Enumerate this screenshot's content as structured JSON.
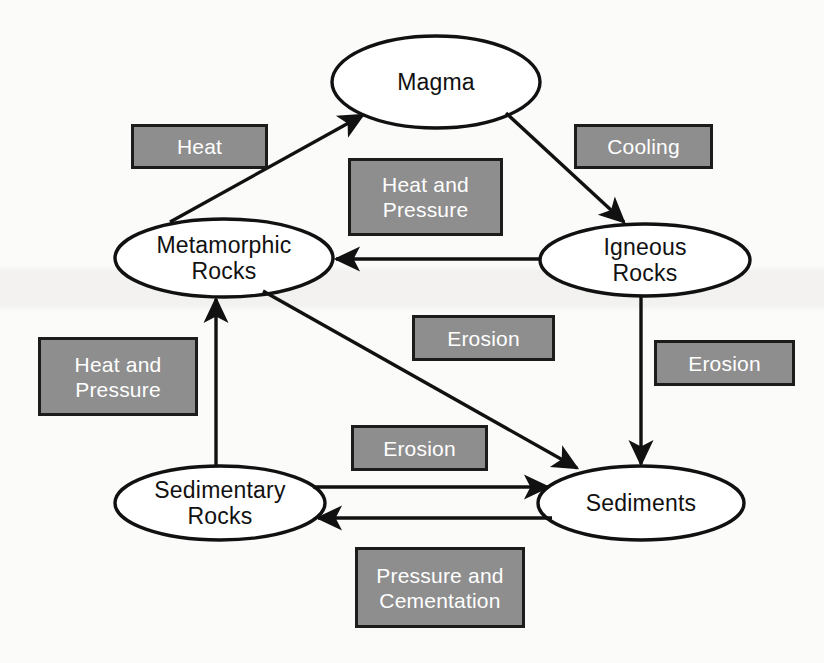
{
  "diagram": {
    "type": "cycle-flow-diagram",
    "canvas": {
      "width": 824,
      "height": 663
    },
    "colors": {
      "background": "#fbfbfa",
      "node_fill": "#ffffff",
      "node_stroke": "#111111",
      "process_fill": "#8e8e8e",
      "process_border": "#1c1c1c",
      "process_text": "#ffffff",
      "node_text": "#111111",
      "arrow": "#111111"
    },
    "nodes": [
      {
        "id": "magma",
        "label": "Magma",
        "shape": "ellipse",
        "cx": 436,
        "cy": 82,
        "rx": 104,
        "ry": 46
      },
      {
        "id": "metamorphic",
        "label": "Metamorphic\nRocks",
        "shape": "ellipse",
        "cx": 224,
        "cy": 258,
        "rx": 109,
        "ry": 39
      },
      {
        "id": "igneous",
        "label": "Igneous\nRocks",
        "shape": "ellipse",
        "cx": 645,
        "cy": 260,
        "rx": 105,
        "ry": 36
      },
      {
        "id": "sedimentary",
        "label": "Sedimentary\nRocks",
        "shape": "ellipse",
        "cx": 220,
        "cy": 503,
        "rx": 105,
        "ry": 37
      },
      {
        "id": "sediments",
        "label": "Sediments",
        "shape": "ellipse",
        "cx": 641,
        "cy": 503,
        "rx": 103,
        "ry": 37
      }
    ],
    "process_boxes": [
      {
        "id": "heat",
        "label": "Heat",
        "x": 131,
        "y": 124,
        "w": 137,
        "h": 45
      },
      {
        "id": "heat-and-pressure-center",
        "label": "Heat and\nPressure",
        "x": 348,
        "y": 158,
        "w": 155,
        "h": 78
      },
      {
        "id": "cooling",
        "label": "Cooling",
        "x": 574,
        "y": 124,
        "w": 139,
        "h": 45
      },
      {
        "id": "erosion-center",
        "label": "Erosion",
        "x": 412,
        "y": 315,
        "w": 143,
        "h": 46
      },
      {
        "id": "erosion-right",
        "label": "Erosion",
        "x": 654,
        "y": 340,
        "w": 141,
        "h": 46
      },
      {
        "id": "heat-and-pressure-left",
        "label": "Heat and\nPressure",
        "x": 38,
        "y": 337,
        "w": 160,
        "h": 79
      },
      {
        "id": "erosion-lower",
        "label": "Erosion",
        "x": 351,
        "y": 425,
        "w": 137,
        "h": 46
      },
      {
        "id": "pressure-and-cementation",
        "label": "Pressure and\nCementation",
        "x": 355,
        "y": 547,
        "w": 170,
        "h": 81
      }
    ],
    "edges": [
      {
        "id": "metamorphic-to-magma",
        "from": "metamorphic",
        "to": "magma",
        "process": "Heat",
        "style": "diagonal"
      },
      {
        "id": "magma-to-igneous",
        "from": "magma",
        "to": "igneous",
        "process": "Cooling",
        "style": "diagonal"
      },
      {
        "id": "igneous-to-metamorphic",
        "from": "igneous",
        "to": "metamorphic",
        "process": "Heat and Pressure",
        "style": "horizontal"
      },
      {
        "id": "igneous-to-sediments",
        "from": "igneous",
        "to": "sediments",
        "process": "Erosion",
        "style": "vertical"
      },
      {
        "id": "metamorphic-to-sediments",
        "from": "metamorphic",
        "to": "sediments",
        "process": "Erosion",
        "style": "diagonal"
      },
      {
        "id": "sedimentary-to-metamorphic",
        "from": "sedimentary",
        "to": "metamorphic",
        "process": "Heat and Pressure",
        "style": "vertical"
      },
      {
        "id": "sedimentary-to-sediments",
        "from": "sedimentary",
        "to": "sediments",
        "process": "Erosion",
        "style": "horizontal"
      },
      {
        "id": "sediments-to-sedimentary",
        "from": "sediments",
        "to": "sedimentary",
        "process": "Pressure and Cementation",
        "style": "horizontal"
      }
    ]
  }
}
